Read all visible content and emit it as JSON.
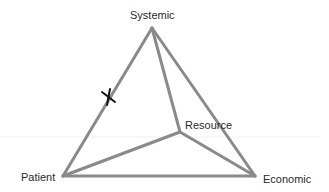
{
  "diagram": {
    "type": "tetrahedron",
    "nodes": {
      "systemic": {
        "label": "Systemic",
        "x": 152,
        "y": 28
      },
      "patient": {
        "label": "Patient",
        "x": 63,
        "y": 176
      },
      "economic": {
        "label": "Economic",
        "x": 255,
        "y": 176
      },
      "resource": {
        "label": "Resource",
        "x": 180,
        "y": 132
      }
    },
    "edges": [
      {
        "from": "systemic",
        "to": "patient"
      },
      {
        "from": "systemic",
        "to": "economic"
      },
      {
        "from": "patient",
        "to": "economic"
      },
      {
        "from": "systemic",
        "to": "resource"
      },
      {
        "from": "patient",
        "to": "resource"
      },
      {
        "from": "economic",
        "to": "resource"
      }
    ],
    "marker": {
      "symbol": "X",
      "on_edge": "systemic-patient",
      "x": 109,
      "y": 97,
      "color": "#111111"
    },
    "colors": {
      "edge": "#8a8a8a",
      "text": "#2a2a2a",
      "background": "#ffffff",
      "guide_line": "#f0f0f0"
    }
  }
}
